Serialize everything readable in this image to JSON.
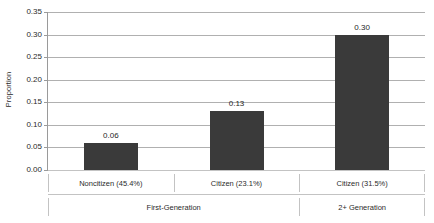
{
  "chart_data": {
    "type": "bar",
    "title": "",
    "xlabel": "",
    "ylabel": "Proportion",
    "categories": [
      "Noncitizen (45.4%)",
      "Citizen (23.1%)",
      "Citizen (31.5%)"
    ],
    "values": [
      0.06,
      0.13,
      0.3
    ],
    "value_labels": [
      "0.06",
      "0.13",
      "0.30"
    ],
    "groups": [
      {
        "label": "First-Generation",
        "categories": [
          "Noncitizen (45.4%)",
          "Citizen (23.1%)"
        ]
      },
      {
        "label": "2+ Generation",
        "categories": [
          "Citizen (31.5%)"
        ]
      }
    ],
    "ylim": [
      0.0,
      0.35
    ],
    "ytick_step": 0.05,
    "ytick_labels": [
      "0.00",
      "0.05",
      "0.10",
      "0.15",
      "0.20",
      "0.25",
      "0.30",
      "0.35"
    ],
    "ytick_values": [
      0.0,
      0.05,
      0.1,
      0.15,
      0.2,
      0.25,
      0.3,
      0.35
    ],
    "grid": true,
    "legend": false,
    "series_color": "#3a3a3a",
    "gridline_color": "#b0b0b0",
    "axis_color": "#9a9a9a",
    "background_color": "#ffffff"
  },
  "axes": {
    "y_title": "Proportion"
  }
}
